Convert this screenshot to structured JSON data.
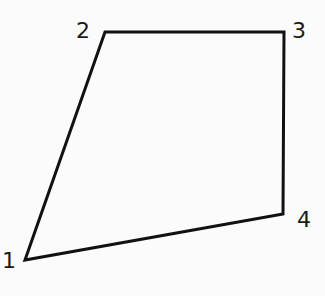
{
  "diagram": {
    "type": "quadrilateral",
    "stroke_color": "#111111",
    "background": "#fbfbfb",
    "vertices": [
      {
        "label": "1",
        "x": 25,
        "y": 260
      },
      {
        "label": "2",
        "x": 105,
        "y": 32
      },
      {
        "label": "3",
        "x": 284,
        "y": 32
      },
      {
        "label": "4",
        "x": 283,
        "y": 214
      }
    ]
  }
}
